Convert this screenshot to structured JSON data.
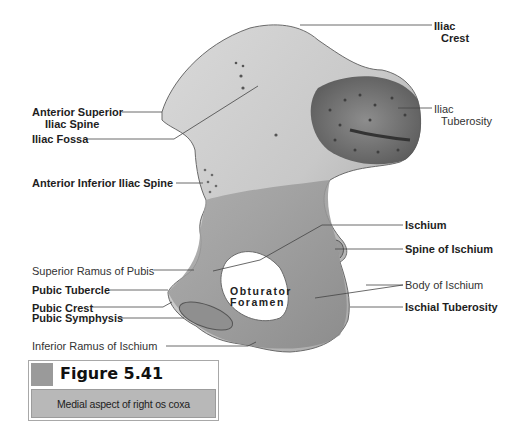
{
  "figure": {
    "number": "Figure 5.41",
    "caption": "Medial aspect of right os coxa",
    "accent_colors": {
      "square": "#9a9a9a",
      "caption_bg": "#b8b8b8",
      "border": "#a8a8a8"
    }
  },
  "labels": {
    "iliac_crest": {
      "line1": "Iliac",
      "line2": "Crest"
    },
    "iliac_tuberosity": {
      "line1": "Iliac",
      "line2": "Tuberosity"
    },
    "anterior_superior_iliac_spine": {
      "line1": "Anterior Superior",
      "line2": "Iliac Spine"
    },
    "iliac_fossa": "Iliac Fossa",
    "anterior_inferior_iliac_spine": "Anterior Inferior Iliac Spine",
    "ischium": "Ischium",
    "spine_of_ischium": "Spine of Ischium",
    "superior_ramus_of_pubis": "Superior Ramus of Pubis",
    "body_of_ischium": "Body of Ischium",
    "pubic_tubercle": "Pubic Tubercle",
    "ischial_tuberosity": "Ischial Tuberosity",
    "pubic_crest": "Pubic Crest",
    "pubic_symphysis": "Pubic Symphysis",
    "inferior_ramus_of_ischium": "Inferior Ramus of Ischium",
    "obturator_foramen": {
      "line1": "Obturator",
      "line2": "Foramen"
    }
  }
}
